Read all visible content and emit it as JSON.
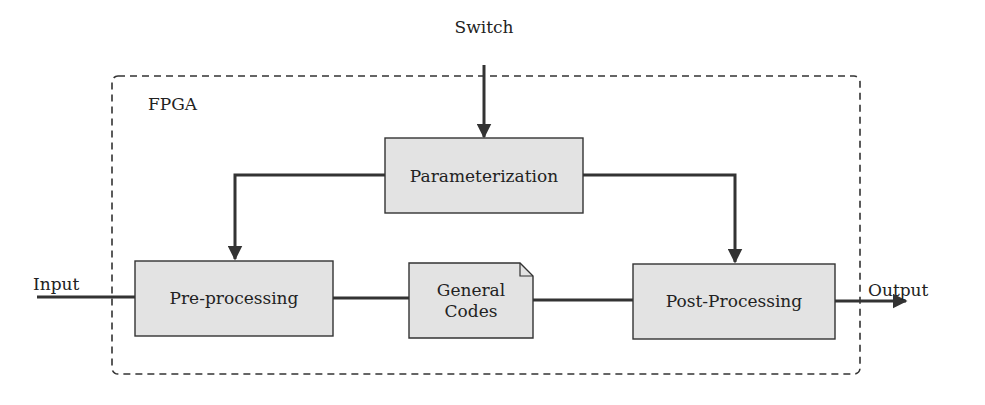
{
  "diagram": {
    "colors": {
      "block_fill": "#e3e3e3",
      "stroke": "#333333",
      "background": "#ffffff"
    },
    "container": {
      "label": "FPGA",
      "style": "dashed"
    },
    "external": {
      "switch_label": "Switch",
      "input_label": "Input",
      "output_label": "Output"
    },
    "blocks": [
      {
        "id": "parameterization",
        "label": "Parameterization"
      },
      {
        "id": "pre-processing",
        "label": "Pre-processing"
      },
      {
        "id": "general-codes",
        "label_line1": "General",
        "label_line2": "Codes",
        "shape": "document"
      },
      {
        "id": "post-processing",
        "label": "Post-Processing"
      }
    ],
    "edges": [
      {
        "from": "Switch",
        "to": "Parameterization"
      },
      {
        "from": "Parameterization",
        "to": "Pre-processing"
      },
      {
        "from": "Parameterization",
        "to": "Post-Processing"
      },
      {
        "from": "Input",
        "to": "Pre-processing"
      },
      {
        "from": "Pre-processing",
        "to": "General Codes"
      },
      {
        "from": "General Codes",
        "to": "Post-Processing"
      },
      {
        "from": "Post-Processing",
        "to": "Output"
      }
    ]
  }
}
